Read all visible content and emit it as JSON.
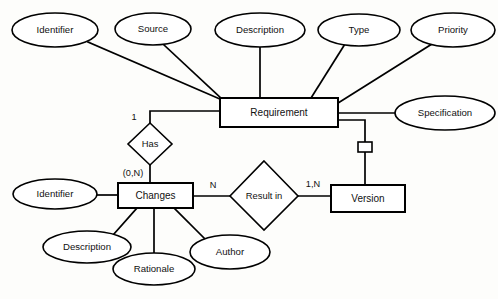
{
  "diagram": {
    "type": "entity-relationship",
    "colors": {
      "stroke": "#000000",
      "fill": "#ffffff",
      "background": "#fdfdfb",
      "text": "#111111"
    },
    "entities": [
      {
        "id": "requirement",
        "label": "Requirement",
        "x": 220,
        "y": 98,
        "w": 118,
        "h": 29
      },
      {
        "id": "changes",
        "label": "Changes",
        "x": 118,
        "y": 183,
        "w": 75,
        "h": 25
      },
      {
        "id": "version",
        "label": "Version",
        "x": 331,
        "y": 185,
        "w": 74,
        "h": 27
      }
    ],
    "relationships": [
      {
        "id": "has",
        "label": "Has",
        "cx": 150,
        "cy": 144,
        "rx": 22,
        "ry": 21
      },
      {
        "id": "result-in",
        "label": "Result in",
        "cx": 264,
        "cy": 194,
        "rx": 34,
        "ry": 34
      }
    ],
    "attributes": [
      {
        "id": "identifier-req",
        "label": "Identifier",
        "cx": 55,
        "cy": 30,
        "rx": 43,
        "ry": 17
      },
      {
        "id": "source",
        "label": "Source",
        "cx": 153,
        "cy": 29,
        "rx": 38,
        "ry": 16
      },
      {
        "id": "description-req",
        "label": "Description",
        "cx": 260,
        "cy": 30,
        "rx": 45,
        "ry": 17
      },
      {
        "id": "type",
        "label": "Type",
        "cx": 359,
        "cy": 30,
        "rx": 41,
        "ry": 16
      },
      {
        "id": "priority",
        "label": "Priority",
        "cx": 453,
        "cy": 30,
        "rx": 42,
        "ry": 17
      },
      {
        "id": "specification",
        "label": "Specification",
        "cx": 445,
        "cy": 113,
        "rx": 50,
        "ry": 17
      },
      {
        "id": "identifier-chg",
        "label": "Identifier",
        "cx": 55,
        "cy": 194,
        "rx": 42,
        "ry": 15
      },
      {
        "id": "description-chg",
        "label": "Description",
        "cx": 87,
        "cy": 247,
        "rx": 44,
        "ry": 16
      },
      {
        "id": "rationale",
        "label": "Rationale",
        "cx": 154,
        "cy": 269,
        "rx": 41,
        "ry": 16
      },
      {
        "id": "author",
        "label": "Author",
        "cx": 230,
        "cy": 252,
        "rx": 40,
        "ry": 17
      }
    ],
    "cardinalities": [
      {
        "id": "card-has-requirement",
        "label": "1",
        "x": 134,
        "y": 118
      },
      {
        "id": "card-has-changes",
        "label": "(0,N)",
        "x": 133,
        "y": 174
      },
      {
        "id": "card-changes-result",
        "label": "N",
        "x": 213,
        "y": 186
      },
      {
        "id": "card-result-version",
        "label": "1,N",
        "x": 313,
        "y": 185
      }
    ],
    "connector": {
      "id": "requirement-version-connector",
      "x": 358,
      "y": 142,
      "w": 14,
      "h": 10
    }
  }
}
